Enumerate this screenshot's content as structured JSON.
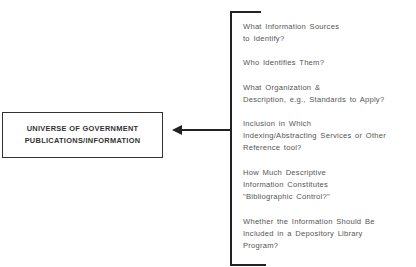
{
  "diagram": {
    "main_box": {
      "lines": [
        "UNIVERSE OF GOVERNMENT",
        "PUBLICATIONS/INFORMATION"
      ]
    },
    "arrow": {
      "direction": "left",
      "from": "bracket",
      "to": "main_box"
    },
    "questions": [
      {
        "lines": [
          "What Information Sources",
          "to Identify?"
        ]
      },
      {
        "lines": [
          "Who Identifies Them?"
        ]
      },
      {
        "lines": [
          "What Organization &",
          "Description, e.g., Standards to Apply?"
        ]
      },
      {
        "lines": [
          "Inclusion in Which",
          "Indexing/Abstracting Services or Other",
          "Reference tool?"
        ]
      },
      {
        "lines": [
          "How Much Descriptive",
          "Information Constitutes",
          "\"Bibliographic Control?\""
        ]
      },
      {
        "lines": [
          "Whether the Information Should Be",
          "Included in a Depository Library",
          "Program?"
        ]
      }
    ],
    "colors": {
      "line": "#222222",
      "box_text": "#333333",
      "question_text": "#555555"
    }
  }
}
